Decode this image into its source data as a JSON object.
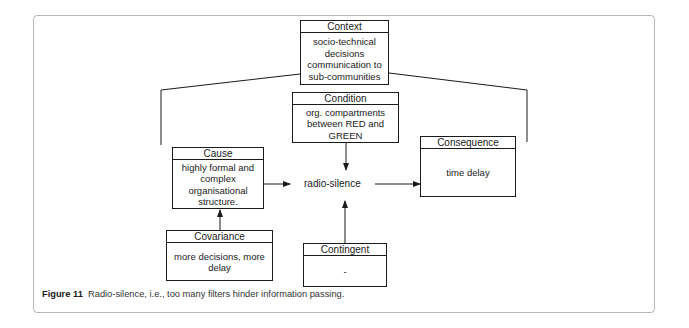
{
  "diagram": {
    "context": {
      "title": "Context",
      "text": "socio-technical decisions communication to sub-communities"
    },
    "condition": {
      "title": "Condition",
      "text": "org. compartments between RED and GREEN"
    },
    "cause": {
      "title": "Cause",
      "text": "highly formal and complex organisational structure."
    },
    "consequence": {
      "title": "Consequence",
      "text": "time delay"
    },
    "covariance": {
      "title": "Covariance",
      "text": "more decisions, more delay"
    },
    "contingent": {
      "title": "Contingent",
      "text": "-"
    },
    "center": "radio-silence",
    "edges": [
      {
        "from": "Cause",
        "to": "radio-silence"
      },
      {
        "from": "Condition",
        "to": "radio-silence"
      },
      {
        "from": "Contingent",
        "to": "radio-silence"
      },
      {
        "from": "radio-silence",
        "to": "Consequence"
      },
      {
        "from": "Covariance",
        "to": "Cause"
      }
    ]
  },
  "caption": {
    "label": "Figure 11",
    "text": "Radio-silence, i.e., too many filters hinder information passing."
  }
}
